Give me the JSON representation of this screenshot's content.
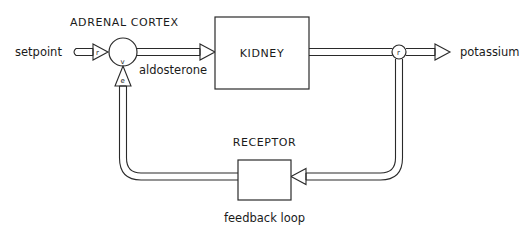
{
  "diagram": {
    "type": "block-diagram",
    "title": "",
    "nodes": {
      "adrenal_cortex": {
        "label": "ADRENAL CORTEX",
        "shape": "circle"
      },
      "kidney": {
        "label": "KIDNEY",
        "shape": "rectangle"
      },
      "receptor": {
        "label": "RECEPTOR",
        "shape": "rectangle"
      },
      "output_junction": {
        "shape": "circle"
      }
    },
    "signals": {
      "input": "setpoint",
      "adrenal_to_kidney": "aldosterone",
      "output": "potassium",
      "loop_caption": "feedback loop"
    },
    "port_labels": {
      "setpoint_arrow": "r",
      "adrenal_vertex": "v",
      "error_arrow": "e",
      "output_junction": "r"
    },
    "edges": [
      {
        "from": "setpoint",
        "to": "adrenal_cortex",
        "label": "r"
      },
      {
        "from": "adrenal_cortex",
        "to": "kidney",
        "label": "aldosterone"
      },
      {
        "from": "kidney",
        "to": "output_junction"
      },
      {
        "from": "output_junction",
        "to": "potassium"
      },
      {
        "from": "output_junction",
        "to": "receptor",
        "label": "feedback loop"
      },
      {
        "from": "receptor",
        "to": "adrenal_cortex",
        "label": "e"
      }
    ],
    "colors": {
      "line": "#2a2a2a",
      "background": "#ffffff",
      "text": "#1a1a1a"
    }
  }
}
